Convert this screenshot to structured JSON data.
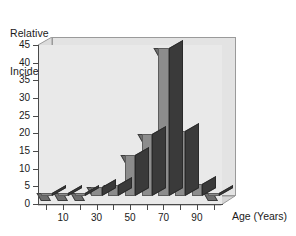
{
  "chart_data": {
    "type": "bar",
    "title": "",
    "ylabel": "Relative\nIncidence",
    "ylabel_line1": "Relative",
    "ylabel_line2": "Incidence",
    "xlabel": "Age (Years)",
    "categories": [
      "0",
      "10",
      "20",
      "30",
      "40",
      "50",
      "60",
      "70",
      "80",
      "90",
      "100"
    ],
    "values": [
      0.3,
      0.3,
      0.3,
      2.5,
      3,
      11.5,
      17.5,
      42,
      18.5,
      3.5,
      0.3
    ],
    "x": [
      0,
      10,
      20,
      30,
      40,
      50,
      60,
      70,
      80,
      90,
      100
    ],
    "xtick_labels": [
      "10",
      "30",
      "50",
      "70",
      "90"
    ],
    "xtick_values": [
      10,
      30,
      50,
      70,
      90
    ],
    "ytick_labels": [
      "0",
      "5",
      "10",
      "15",
      "20",
      "25",
      "30",
      "35",
      "40",
      "45"
    ],
    "ytick_values": [
      0,
      5,
      10,
      15,
      20,
      25,
      30,
      35,
      40,
      45
    ],
    "ylim": [
      0,
      45
    ],
    "grid": false,
    "legend": "none",
    "style": "3d-bar",
    "colors": {
      "bar_face": "#8c8c8c",
      "bar_side": "#3a3a3a",
      "bar_top": "#6e6e6e",
      "plot_background": "#e9e9e9",
      "back_wall": "#e3e3e3",
      "axis": "#4a4a4a",
      "text": "#1a1a1a",
      "page_background": "#ffffff"
    }
  }
}
